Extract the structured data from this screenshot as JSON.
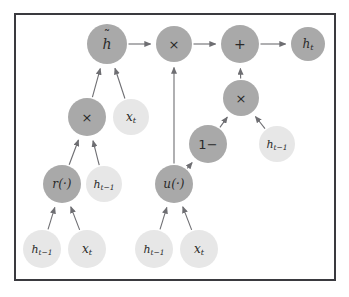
{
  "figure": {
    "kind": "gated-recurrent-unit-computation-graph",
    "frame": {
      "border_color": "#3a3a3f",
      "background_color": "#ffffff"
    },
    "palette": {
      "node_dark": "#a9a9a9",
      "node_light": "#e7e7e7",
      "edge_color": "#6e6e72",
      "label_color": "#2a2a2a",
      "page_background": "#ffffff"
    },
    "nodes": [
      {
        "id": "h_tilde",
        "label": "h",
        "accent": "tilde",
        "style": "dark",
        "cx": 107,
        "cy": 44,
        "r": 20,
        "font_size": 14
      },
      {
        "id": "mult_top",
        "label": "×",
        "style": "dark",
        "cx": 174,
        "cy": 44,
        "r": 18,
        "font_size": 13
      },
      {
        "id": "plus_top",
        "label": "+",
        "style": "dark",
        "cx": 240,
        "cy": 44,
        "r": 19,
        "font_size": 14
      },
      {
        "id": "h_t",
        "label": "h",
        "sub": "t",
        "style": "dark",
        "cx": 308,
        "cy": 44,
        "r": 17,
        "font_size": 12
      },
      {
        "id": "mult_left",
        "label": "×",
        "style": "dark",
        "cx": 87,
        "cy": 117,
        "r": 19,
        "font_size": 13
      },
      {
        "id": "x_t_left_mid",
        "label": "x",
        "sub": "t",
        "style": "light",
        "cx": 131,
        "cy": 117,
        "r": 18,
        "font_size": 12
      },
      {
        "id": "mult_right",
        "label": "×",
        "style": "dark",
        "cx": 241,
        "cy": 98,
        "r": 18,
        "font_size": 13
      },
      {
        "id": "one_minus",
        "label": "1−",
        "style": "dark",
        "cx": 208,
        "cy": 144,
        "r": 19,
        "font_size": 13
      },
      {
        "id": "h_tm1_right",
        "label": "h",
        "sub": "t−1",
        "style": "light",
        "cx": 277,
        "cy": 144,
        "r": 18,
        "font_size": 11
      },
      {
        "id": "r_gate",
        "label": "r(·)",
        "style": "dark",
        "cx": 62,
        "cy": 184,
        "r": 19,
        "font_size": 12
      },
      {
        "id": "h_tm1_left",
        "label": "h",
        "sub": "t−1",
        "style": "light",
        "cx": 104,
        "cy": 184,
        "r": 18,
        "font_size": 11
      },
      {
        "id": "u_gate",
        "label": "u(·)",
        "style": "dark",
        "cx": 174,
        "cy": 184,
        "r": 19,
        "font_size": 12
      },
      {
        "id": "h_tm1_bottom_left",
        "label": "h",
        "sub": "t−1",
        "style": "light",
        "cx": 42,
        "cy": 249,
        "r": 19,
        "font_size": 11
      },
      {
        "id": "x_t_bottom_left",
        "label": "x",
        "sub": "t",
        "style": "light",
        "cx": 87,
        "cy": 249,
        "r": 19,
        "font_size": 12
      },
      {
        "id": "h_tm1_bottom_right",
        "label": "h",
        "sub": "t−1",
        "style": "light",
        "cx": 154,
        "cy": 249,
        "r": 19,
        "font_size": 11
      },
      {
        "id": "x_t_bottom_right",
        "label": "x",
        "sub": "t",
        "style": "light",
        "cx": 199,
        "cy": 249,
        "r": 19,
        "font_size": 12
      }
    ],
    "edges": [
      {
        "from": "h_tilde",
        "to": "mult_top"
      },
      {
        "from": "mult_top",
        "to": "plus_top"
      },
      {
        "from": "plus_top",
        "to": "h_t"
      },
      {
        "from": "mult_left",
        "to": "h_tilde"
      },
      {
        "from": "x_t_left_mid",
        "to": "h_tilde"
      },
      {
        "from": "r_gate",
        "to": "mult_left"
      },
      {
        "from": "h_tm1_left",
        "to": "mult_left"
      },
      {
        "from": "h_tm1_bottom_left",
        "to": "r_gate"
      },
      {
        "from": "x_t_bottom_left",
        "to": "r_gate"
      },
      {
        "from": "u_gate",
        "to": "mult_top"
      },
      {
        "from": "u_gate",
        "to": "one_minus"
      },
      {
        "from": "h_tm1_bottom_right",
        "to": "u_gate"
      },
      {
        "from": "x_t_bottom_right",
        "to": "u_gate"
      },
      {
        "from": "one_minus",
        "to": "mult_right"
      },
      {
        "from": "h_tm1_right",
        "to": "mult_right"
      },
      {
        "from": "mult_right",
        "to": "plus_top"
      }
    ]
  }
}
